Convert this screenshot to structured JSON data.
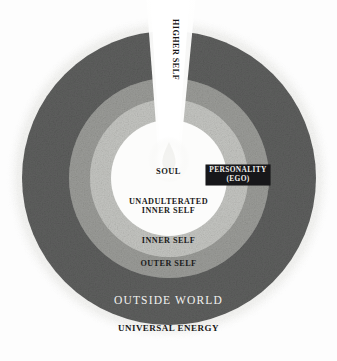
{
  "diagram": {
    "background_color": "#fdfdfd",
    "center": {
      "x": 169,
      "y": 178
    },
    "rings": [
      {
        "name": "universal-energy",
        "label": "UNIVERSAL ENERGY",
        "radius": 163,
        "color": "#ededeb",
        "text_color": "#1a1a1a"
      },
      {
        "name": "outside-world",
        "label": "OUTSIDE WORLD",
        "radius": 147,
        "color": "#5e5f5e",
        "text_color": "#f2f2f0"
      },
      {
        "name": "outer-self",
        "label": "OUTER SELF",
        "radius": 100,
        "color": "#9b9c98",
        "text_color": "#1a1a1a"
      },
      {
        "name": "inner-self",
        "label": "INNER SELF",
        "radius": 79,
        "color": "#c2c3bf",
        "text_color": "#1a1a1a"
      },
      {
        "name": "unadulterated-inner-self",
        "label": "UNADULTERATED\nINNER SELF",
        "radius": 58,
        "color": "#ffffff",
        "text_color": "#1a1a1a"
      }
    ],
    "labels": {
      "soul": "SOUL",
      "unadulterated_line1": "UNADULTERATED",
      "unadulterated_line2": "INNER SELF",
      "inner_self": "INNER SELF",
      "outer_self": "OUTER SELF",
      "outside_world": "OUTSIDE WORLD",
      "universal_energy": "UNIVERSAL ENERGY",
      "higher_self": "HIGHER SELF"
    },
    "personality_callout": {
      "line1": "PERSONALITY",
      "line2": "(EGO)",
      "background_color": "#17171a",
      "text_color": "#f0efec"
    },
    "higher_self_beam": {
      "label": "HIGHER SELF",
      "color": "#fbfbfa",
      "direction": "upward-from-center"
    },
    "soul_glow": {
      "name": "soul-flame",
      "color": "#ffffff"
    }
  }
}
